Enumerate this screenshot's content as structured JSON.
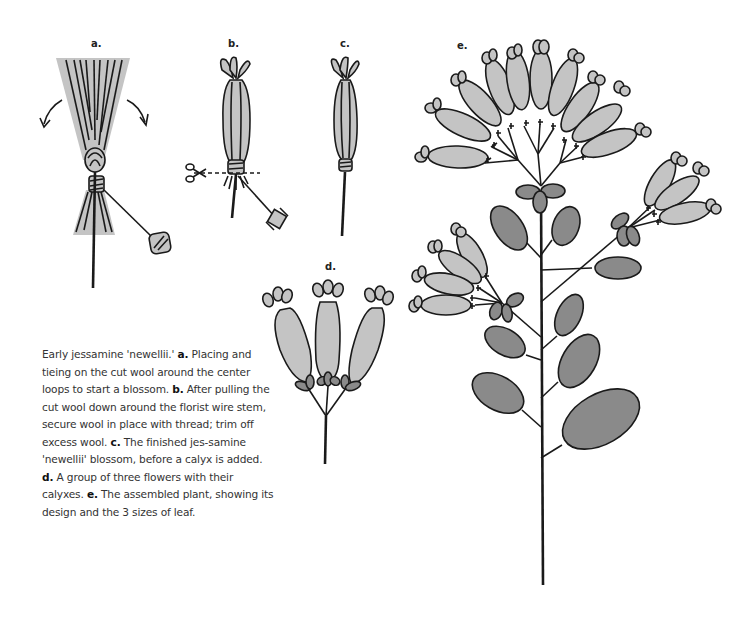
{
  "figure_labels": {
    "a": "a.",
    "b": "b.",
    "c": "c.",
    "d": "d.",
    "e": "e."
  },
  "caption": {
    "intro": "Early jessamine 'newellii.' ",
    "a_label": "a.",
    "a_text": " Placing and tieing on the cut wool around the center loops to start a blossom. ",
    "b_label": "b.",
    "b_text": " After pulling the cut wool down around the florist wire stem, secure wool in place with thread; trim off excess wool. ",
    "c_label": "c.",
    "c_text": " The finished jes-samine 'newellii' blossom, before a calyx is added. ",
    "d_label": "d.",
    "d_text": " A group of three flowers with their calyxes. ",
    "e_label": "e.",
    "e_text": " The assembled plant, showing its design and the 3 sizes of leaf."
  },
  "colors": {
    "blossom_fill": "#c4c4c4",
    "leaf_fill": "#8a8a8a",
    "outline": "#1a1a1a",
    "background": "#ffffff"
  },
  "illustrations": [
    {
      "id": "a",
      "subject": "cut wool fan tied around center loops with thread spool"
    },
    {
      "id": "b",
      "subject": "wrapped blossom with scissors and dashed cut line, thread spool"
    },
    {
      "id": "c",
      "subject": "finished blossom on wire stem"
    },
    {
      "id": "d",
      "subject": "group of three flowers with calyxes"
    },
    {
      "id": "e",
      "subject": "assembled plant with flower clusters and leaves"
    }
  ]
}
